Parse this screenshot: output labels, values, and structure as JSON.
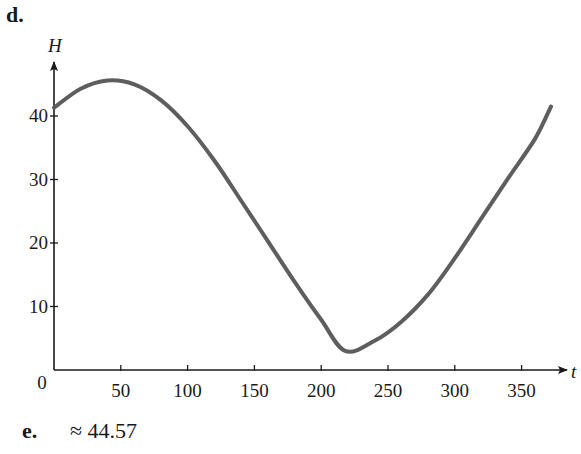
{
  "labels": {
    "part_d": "d.",
    "part_e": "e.",
    "answer_e": "≈ 44.57"
  },
  "colors": {
    "curve": "#5e5e5e",
    "axis": "#1a1a1a"
  },
  "chart_data": {
    "type": "line",
    "title": "",
    "xlabel": "t",
    "ylabel": "H",
    "xlim": [
      0,
      375
    ],
    "ylim": [
      0,
      49
    ],
    "grid": false,
    "legend": null,
    "x_ticks": [
      0,
      50,
      100,
      150,
      200,
      250,
      300,
      350
    ],
    "x_tick_labels": [
      "0",
      "50",
      "100",
      "150",
      "200",
      "250",
      "300",
      "350"
    ],
    "y_ticks": [
      10,
      20,
      30,
      40
    ],
    "y_tick_labels": [
      "10",
      "20",
      "30",
      "40"
    ],
    "series": [
      {
        "name": "H(t)",
        "x": [
          0,
          20,
          40,
          60,
          80,
          100,
          120,
          140,
          160,
          180,
          200,
          218,
          240,
          260,
          280,
          300,
          320,
          340,
          360,
          372
        ],
        "values": [
          41.3,
          44.3,
          45.6,
          45.0,
          42.5,
          38.4,
          33.0,
          26.7,
          20.3,
          13.9,
          7.9,
          3.0,
          4.6,
          7.6,
          11.9,
          17.6,
          23.9,
          30.2,
          36.4,
          41.5
        ]
      }
    ],
    "annotations": []
  }
}
